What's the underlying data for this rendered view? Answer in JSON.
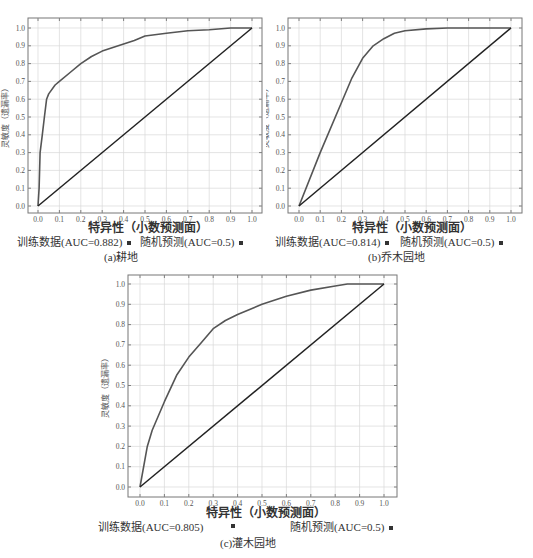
{
  "chart_data": [
    {
      "id": "a",
      "type": "line",
      "title": "",
      "caption": "(a)耕地",
      "xlabel": "特异性（小数预测面）",
      "ylabel": "灵敏度（遗漏率）",
      "xlim": [
        0,
        1
      ],
      "ylim": [
        0,
        1
      ],
      "xticks": [
        "0.0",
        "0.1",
        "0.2",
        "0.3",
        "0.4",
        "0.5",
        "0.6",
        "0.7",
        "0.8",
        "0.9",
        "1.0"
      ],
      "yticks": [
        "0.0",
        "0.1",
        "0.2",
        "0.3",
        "0.4",
        "0.5",
        "0.6",
        "0.7",
        "0.8",
        "0.9",
        "1.0"
      ],
      "grid": true,
      "legend_position": "below",
      "series": [
        {
          "name": "训练数据(AUC=0.882)",
          "color": "#555555",
          "x": [
            0,
            0.005,
            0.01,
            0.02,
            0.03,
            0.04,
            0.05,
            0.08,
            0.1,
            0.15,
            0.2,
            0.25,
            0.3,
            0.35,
            0.4,
            0.45,
            0.5,
            0.6,
            0.7,
            0.8,
            0.9,
            1.0
          ],
          "y": [
            0,
            0.1,
            0.3,
            0.4,
            0.5,
            0.6,
            0.63,
            0.68,
            0.7,
            0.75,
            0.8,
            0.84,
            0.87,
            0.89,
            0.91,
            0.93,
            0.955,
            0.97,
            0.985,
            0.99,
            1.0,
            1.0
          ]
        },
        {
          "name": "随机预测(AUC=0.5)",
          "color": "#222222",
          "x": [
            0,
            1
          ],
          "y": [
            0,
            1
          ]
        }
      ]
    },
    {
      "id": "b",
      "type": "line",
      "title": "",
      "caption": "(b)乔木园地",
      "xlabel": "特异性（小数预测面）",
      "ylabel": "灵敏度（遗漏率）",
      "xlim": [
        0,
        1
      ],
      "ylim": [
        0,
        1
      ],
      "xticks": [
        "0.0",
        "0.1",
        "0.2",
        "0.3",
        "0.4",
        "0.5",
        "0.6",
        "0.7",
        "0.8",
        "0.9",
        "1.0"
      ],
      "yticks": [
        "0.0",
        "0.1",
        "0.2",
        "0.3",
        "0.4",
        "0.5",
        "0.6",
        "0.7",
        "0.8",
        "0.9",
        "1.0"
      ],
      "grid": true,
      "legend_position": "below",
      "series": [
        {
          "name": "训练数据(AUC=0.814)",
          "color": "#555555",
          "x": [
            0,
            0.1,
            0.2,
            0.25,
            0.3,
            0.35,
            0.4,
            0.45,
            0.5,
            0.6,
            0.7,
            1.0
          ],
          "y": [
            0,
            0.3,
            0.58,
            0.72,
            0.83,
            0.9,
            0.94,
            0.97,
            0.985,
            0.995,
            1.0,
            1.0
          ]
        },
        {
          "name": "随机预测(AUC=0.5)",
          "color": "#222222",
          "x": [
            0,
            1
          ],
          "y": [
            0,
            1
          ]
        }
      ]
    },
    {
      "id": "c",
      "type": "line",
      "title": "",
      "caption": "(c)灌木园地",
      "xlabel": "特异性（小数预测面）",
      "ylabel": "灵敏度（遗漏率）",
      "xlim": [
        0,
        1
      ],
      "ylim": [
        0,
        1
      ],
      "xticks": [
        "0.0",
        "0.1",
        "0.2",
        "0.3",
        "0.4",
        "0.5",
        "0.6",
        "0.7",
        "0.8",
        "0.9",
        "1.0"
      ],
      "yticks": [
        "0.0",
        "0.1",
        "0.2",
        "0.3",
        "0.4",
        "0.5",
        "0.6",
        "0.7",
        "0.8",
        "0.9",
        "1.0"
      ],
      "grid": true,
      "legend_position": "below",
      "series": [
        {
          "name": "训练数据(AUC=0.805)",
          "color": "#555555",
          "x": [
            0,
            0.03,
            0.05,
            0.1,
            0.15,
            0.2,
            0.25,
            0.3,
            0.35,
            0.4,
            0.5,
            0.6,
            0.7,
            0.8,
            0.85,
            1.0
          ],
          "y": [
            0,
            0.2,
            0.28,
            0.42,
            0.55,
            0.64,
            0.71,
            0.78,
            0.82,
            0.85,
            0.9,
            0.94,
            0.97,
            0.99,
            1.0,
            1.0
          ]
        },
        {
          "name": "随机预测(AUC=0.5)",
          "color": "#222222",
          "x": [
            0,
            1
          ],
          "y": [
            0,
            1
          ]
        }
      ]
    }
  ],
  "panels": {
    "a": {
      "caption": "(a)耕地",
      "xlabel": "特异性（小数预测面）",
      "ylabel": "灵敏度（遗漏率）",
      "legend_train": "训练数据(AUC=0.882)",
      "legend_random": "随机预测(AUC=0.5)"
    },
    "b": {
      "caption": "(b)乔木园地",
      "xlabel": "特异性（小数预测面）",
      "ylabel": "灵敏度（遗漏率）",
      "legend_train": "训练数据(AUC=0.814)",
      "legend_random": "随机预测(AUC=0.5)"
    },
    "c": {
      "caption": "(c)灌木园地",
      "xlabel": "特异性（小数预测面）",
      "ylabel": "灵敏度（遗漏率）",
      "legend_train": "训练数据(AUC=0.805)",
      "legend_random": "随机预测(AUC=0.5)"
    }
  }
}
